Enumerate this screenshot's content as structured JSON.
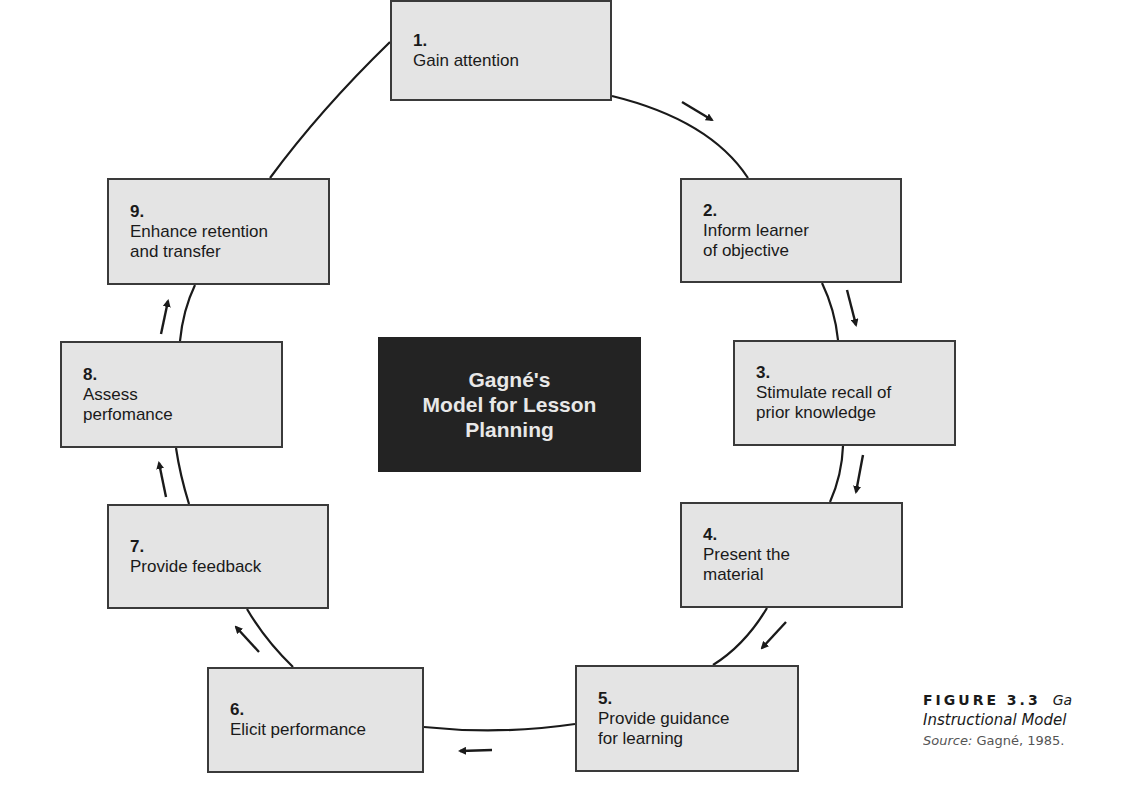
{
  "diagram": {
    "center_title": "Gagné's\nModel for Lesson\nPlanning",
    "steps": [
      {
        "num": "1.",
        "label": "Gain attention"
      },
      {
        "num": "2.",
        "label": "Inform learner\nof objective"
      },
      {
        "num": "3.",
        "label": "Stimulate recall of\nprior knowledge"
      },
      {
        "num": "4.",
        "label": "Present the\nmaterial"
      },
      {
        "num": "5.",
        "label": "Provide guidance\nfor learning"
      },
      {
        "num": "6.",
        "label": "Elicit performance"
      },
      {
        "num": "7.",
        "label": "Provide feedback"
      },
      {
        "num": "8.",
        "label": "Assess\nperfomance"
      },
      {
        "num": "9.",
        "label": "Enhance retention\nand transfer"
      }
    ],
    "flow_direction": "clockwise",
    "colors": {
      "box_fill": "#e4e4e4",
      "box_border": "#3a3a3a",
      "center_fill": "#232323",
      "center_text": "#e8e8e8"
    }
  },
  "caption": {
    "figure_number": "FIGURE 3.3",
    "title_line1": "Ga",
    "title_line2": "Instructional Model",
    "source_label": "Source:",
    "source_value": "Gagné, 1985."
  }
}
